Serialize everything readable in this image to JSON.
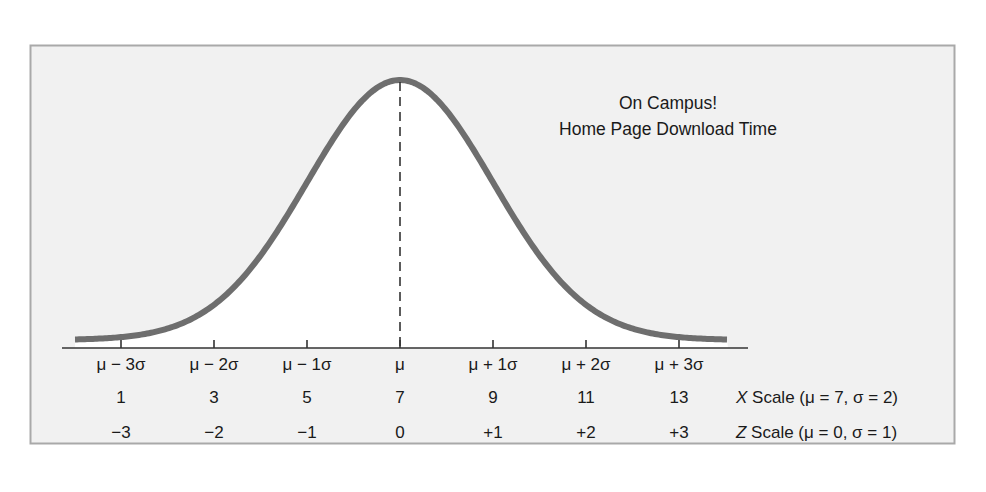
{
  "chart_data": {
    "type": "line",
    "title": "On Campus! Home Page Download Time",
    "title_lines": [
      "On Campus!",
      "Home Page Download Time"
    ],
    "distribution": "normal",
    "mean": 7,
    "std_dev": 2,
    "x": [
      1,
      3,
      5,
      7,
      9,
      11,
      13
    ],
    "sigma_labels": [
      "μ − 3σ",
      "μ − 2σ",
      "μ − 1σ",
      "μ",
      "μ + 1σ",
      "μ + 2σ",
      "μ + 3σ"
    ],
    "series": [
      {
        "name": "X Scale (μ = 7, σ = 2)",
        "values": [
          "1",
          "3",
          "5",
          "7",
          "9",
          "11",
          "13"
        ]
      },
      {
        "name": "Z Scale (μ = 0, σ = 1)",
        "values": [
          "−3",
          "−2",
          "−1",
          "0",
          "+1",
          "+2",
          "+3"
        ]
      }
    ],
    "x_scale_label": {
      "var": "X",
      "text": " Scale (μ = 7, σ = 2)"
    },
    "z_scale_label": {
      "var": "Z",
      "text": " Scale (μ = 0, σ = 1)"
    },
    "annotations": [
      "dashed vertical line at mean μ"
    ],
    "grid": false,
    "legend": "none",
    "xlabel": "",
    "ylabel": ""
  },
  "colors": {
    "panel_bg": "#f1f1f1",
    "panel_border": "#a9a9a9",
    "curve_fill": "#ffffff",
    "curve_stroke": "#6e6e6e",
    "axis": "#333333",
    "mean_line": "#333333"
  }
}
